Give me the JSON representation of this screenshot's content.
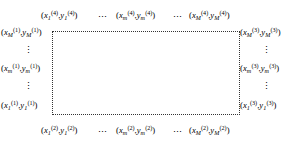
{
  "figure": {
    "type": "boundary-point-diagram",
    "background_color": "#ffffff",
    "text_color": "#000000",
    "rect_border_color": "#333333",
    "rect_border_style": "dotted",
    "horizontal_ellipsis": "⋯",
    "vertical_ellipsis": "⋮",
    "open_paren": "(",
    "close_paren": ")",
    "comma": ","
  },
  "edges": {
    "top": {
      "boundary_index": "4",
      "points": [
        {
          "x_var": "x",
          "y_var": "y",
          "index": "1",
          "superscript": "(4)"
        },
        {
          "x_var": "x",
          "y_var": "y",
          "index": "m",
          "superscript": "(4)"
        },
        {
          "x_var": "x",
          "y_var": "y",
          "index": "M",
          "superscript": "(4)"
        }
      ]
    },
    "left": {
      "boundary_index": "1",
      "points": [
        {
          "x_var": "x",
          "y_var": "y",
          "index": "M",
          "superscript": "(1)"
        },
        {
          "x_var": "x",
          "y_var": "y",
          "index": "m",
          "superscript": "(1)"
        },
        {
          "x_var": "x",
          "y_var": "y",
          "index": "1",
          "superscript": "(1)"
        }
      ]
    },
    "right": {
      "boundary_index": "3",
      "points": [
        {
          "x_var": "x",
          "y_var": "y",
          "index": "M",
          "superscript": "(3)"
        },
        {
          "x_var": "x",
          "y_var": "y",
          "index": "m",
          "superscript": "(3)"
        },
        {
          "x_var": "x",
          "y_var": "y",
          "index": "1",
          "superscript": "(3)"
        }
      ]
    },
    "bottom": {
      "boundary_index": "2",
      "points": [
        {
          "x_var": "x",
          "y_var": "y",
          "index": "1",
          "superscript": "(2)"
        },
        {
          "x_var": "x",
          "y_var": "y",
          "index": "m",
          "superscript": "(2)"
        },
        {
          "x_var": "x",
          "y_var": "y",
          "index": "M",
          "superscript": "(2)"
        }
      ]
    }
  }
}
